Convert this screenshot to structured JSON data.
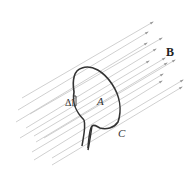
{
  "diagram": {
    "title": "",
    "labels": {
      "field": "B",
      "area": "A",
      "curve": "C",
      "line_element": "Δl"
    },
    "colors": {
      "field_lines": "#c4c4c4",
      "arrowheads": "#9a9a9a",
      "loop": "#333333",
      "text": "#333333"
    },
    "field_lines": [
      {
        "x1": 22,
        "y1": 98,
        "x2": 153,
        "y2": 22
      },
      {
        "x1": 18,
        "y1": 110,
        "x2": 148,
        "y2": 32
      },
      {
        "x1": 30,
        "y1": 114,
        "x2": 162,
        "y2": 38
      },
      {
        "x1": 16,
        "y1": 122,
        "x2": 147,
        "y2": 43
      },
      {
        "x1": 26,
        "y1": 128,
        "x2": 156,
        "y2": 49
      },
      {
        "x1": 20,
        "y1": 138,
        "x2": 149,
        "y2": 61
      },
      {
        "x1": 34,
        "y1": 136,
        "x2": 165,
        "y2": 58
      },
      {
        "x1": 44,
        "y1": 138,
        "x2": 175,
        "y2": 60
      },
      {
        "x1": 36,
        "y1": 142,
        "x2": 167,
        "y2": 63
      },
      {
        "x1": 32,
        "y1": 152,
        "x2": 163,
        "y2": 74
      },
      {
        "x1": 52,
        "y1": 158,
        "x2": 183,
        "y2": 80
      },
      {
        "x1": 34,
        "y1": 160,
        "x2": 162,
        "y2": 81
      },
      {
        "x1": 52,
        "y1": 165,
        "x2": 182,
        "y2": 87
      }
    ]
  }
}
